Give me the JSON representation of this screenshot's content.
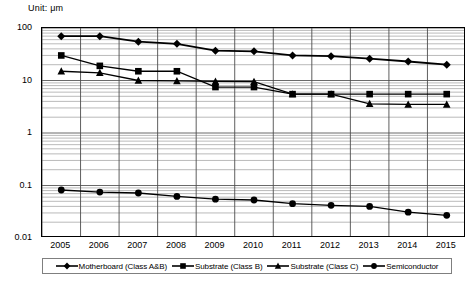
{
  "chart_data": {
    "type": "line",
    "title": "Unit:  μm",
    "xlabel": "",
    "ylabel": "",
    "yscale": "log",
    "ylim": [
      0.01,
      100
    ],
    "ytick_labels": [
      "100",
      "10",
      "1",
      "0.1",
      "0.01"
    ],
    "ytick_values": [
      100,
      10,
      1,
      0.1,
      0.01
    ],
    "grid": true,
    "grid_minor": true,
    "legend_position": "bottom",
    "categories": [
      "2005",
      "2006",
      "2007",
      "2008",
      "2009",
      "2010",
      "2011",
      "2012",
      "2013",
      "2014",
      "2015"
    ],
    "series": [
      {
        "name": "Motherboard (Class A&B)",
        "marker": "diamond",
        "color": "#000000",
        "values": [
          70,
          70,
          55,
          50,
          37,
          36,
          30,
          29,
          26,
          23,
          20
        ]
      },
      {
        "name": "Substrate (Class B)",
        "marker": "square",
        "color": "#000000",
        "values": [
          30,
          19,
          15,
          15,
          7.5,
          7.5,
          5.5,
          5.5,
          5.5,
          5.5,
          5.5
        ]
      },
      {
        "name": "Substrate (Class C)",
        "marker": "triangle",
        "color": "#000000",
        "values": [
          15,
          14,
          10,
          9.8,
          9.6,
          9.5,
          5.5,
          5.5,
          3.6,
          3.5,
          3.5
        ]
      },
      {
        "name": "Semiconductor",
        "marker": "circle",
        "color": "#000000",
        "values": [
          0.082,
          0.075,
          0.072,
          0.062,
          0.055,
          0.053,
          0.045,
          0.042,
          0.04,
          0.031,
          0.027
        ]
      }
    ]
  },
  "legend": {
    "items": [
      {
        "label": "Motherboard (Class A&B)",
        "marker": "diamond"
      },
      {
        "label": "Substrate (Class B)",
        "marker": "square"
      },
      {
        "label": "Substrate (Class C)",
        "marker": "triangle"
      },
      {
        "label": "Semiconductor",
        "marker": "circle"
      }
    ]
  }
}
